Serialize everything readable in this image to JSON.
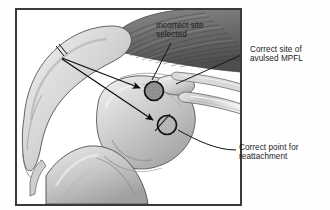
{
  "figure": {
    "name": "knee-mpfl-reattachment-diagram",
    "kind": "medical-illustration",
    "view": "sagittal-oblique knee joint",
    "palette": {
      "background": "#fefefe",
      "frame_border": "#3a3a3a",
      "line_ink": "#111111",
      "text": "#1c1c1c",
      "bone_light": "#e7e7e7",
      "bone_mid": "#c2c2c2",
      "bone_shadow": "#9a9a9a",
      "muscle_dark": "#6d6d6d",
      "muscle_darkest": "#4a4a4a",
      "marker_incorrect_fill": "#8a8a8a",
      "marker_correct_fill": "#b5b5b5",
      "marker_stroke": "#101010"
    },
    "frame": {
      "x": 16,
      "y": 9,
      "width": 225,
      "height": 196,
      "stroke_width": 2
    }
  },
  "annotations": [
    {
      "id": "incorrect-site",
      "text": "Incorrect site\nselected",
      "line1": "Incorrect site",
      "line2": "selected",
      "position": "inside-top-center",
      "leader": "diagonal down-left to upper marker"
    },
    {
      "id": "correct-site",
      "text": "Correct site of\navulsed MPFL",
      "line1": "Correct site of",
      "line2": "avulsed MPFL",
      "position": "outside-right-upper",
      "leader": "long diagonal left into joint"
    },
    {
      "id": "correct-point",
      "text": "Correct point for\nreattachment",
      "line1": "Correct point for",
      "line2": "reattachment",
      "position": "outside-right-lower",
      "leader": "short curve up-left to lower marker"
    }
  ],
  "markers": [
    {
      "id": "marker-incorrect",
      "label": "Incorrect site selected",
      "cx": 154,
      "cy": 91,
      "r": 9.5,
      "fill": "#8a8a8a",
      "texture": "stipple",
      "meaning": "incorrect graft fixation site"
    },
    {
      "id": "marker-correct",
      "label": "Correct point for reattachment",
      "cx": 167,
      "cy": 125,
      "r": 9.5,
      "fill": "#b5b5b5",
      "texture": "stipple",
      "meaning": "anatomic MPFL femoral attachment point"
    }
  ],
  "arrows": [
    {
      "id": "arrow-to-incorrect",
      "from": [
        62,
        58
      ],
      "to": [
        143,
        89
      ],
      "head": "solid-triangle",
      "points_to": "marker-incorrect"
    },
    {
      "id": "arrow-to-correct",
      "from": [
        62,
        59
      ],
      "to": [
        156,
        122
      ],
      "head": "solid-triangle",
      "points_to": "marker-correct"
    }
  ],
  "anatomy": [
    {
      "id": "femur-shaft",
      "name": "femoral shaft"
    },
    {
      "id": "femoral-condyle",
      "name": "medial femoral condyle"
    },
    {
      "id": "quadriceps-muscle",
      "name": "quadriceps muscle belly"
    },
    {
      "id": "patella",
      "name": "patella"
    },
    {
      "id": "patellar-tendon",
      "name": "patellar tendon"
    },
    {
      "id": "tibia",
      "name": "tibial plateau / proximal tibia"
    }
  ]
}
